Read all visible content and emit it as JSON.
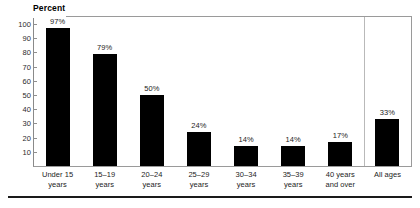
{
  "chart_data": {
    "type": "bar",
    "title": "",
    "ylabel": "Percent",
    "xlabel": "",
    "ylim": [
      0,
      105
    ],
    "yticks": [
      10,
      20,
      30,
      40,
      50,
      60,
      70,
      80,
      90,
      100
    ],
    "grid": false,
    "legend": "none",
    "categories": [
      "Under 15 years",
      "15–19 years",
      "20–24 years",
      "25–29 years",
      "30–34 years",
      "35–39 years",
      "40 years and over",
      "All ages"
    ],
    "category_lines": [
      [
        "Under 15",
        "years"
      ],
      [
        "15–19",
        "years"
      ],
      [
        "20–24",
        "years"
      ],
      [
        "25–29",
        "years"
      ],
      [
        "30–34",
        "years"
      ],
      [
        "35–39",
        "years"
      ],
      [
        "40 years",
        "and over"
      ],
      [
        "All ages",
        ""
      ]
    ],
    "values": [
      97,
      79,
      50,
      24,
      14,
      14,
      17,
      33
    ],
    "value_labels": [
      "97%",
      "79%",
      "50%",
      "24%",
      "14%",
      "14%",
      "17%",
      "33%"
    ],
    "separator_after_index": 6,
    "bar_color": "#000000",
    "frame_color": "#9a9a9a",
    "text_color": "#1d1d1d"
  },
  "axis": {
    "y_title": "Percent",
    "tick_labels": [
      "100",
      "90",
      "80",
      "70",
      "60",
      "50",
      "40",
      "30",
      "20",
      "10"
    ]
  }
}
